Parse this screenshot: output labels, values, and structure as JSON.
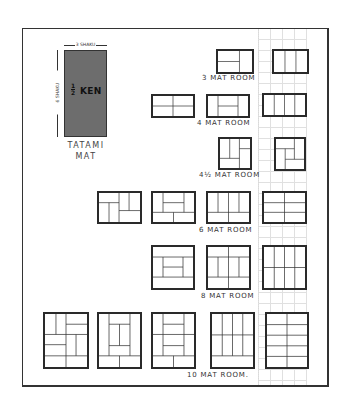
{
  "diagram": {
    "tatami_mat": {
      "width_label": "3 SHAKU",
      "height_label": "6 SHAKU",
      "fraction": "1/2",
      "fraction_num": "1",
      "fraction_den": "2",
      "unit": "KEN",
      "caption_line1": "TATAMI",
      "caption_line2": "MAT",
      "fill_color": "#6d6d6d"
    },
    "room_groups": [
      {
        "label": "3 MAT ROOM",
        "variants": 2
      },
      {
        "label": "4 MAT ROOM",
        "variants": 3
      },
      {
        "label_whole": "4",
        "label_fraction": "½",
        "label": "4½ MAT ROOM",
        "variants": 2
      },
      {
        "label": "6 MAT ROOM",
        "variants": 4
      },
      {
        "label": "8 MAT ROOM",
        "variants": 3
      },
      {
        "label": "10 MAT ROOM.",
        "variants": 5
      }
    ],
    "colors": {
      "line": "#2a2a2a",
      "grid": "#c8c8c8",
      "background": "#ffffff"
    }
  }
}
